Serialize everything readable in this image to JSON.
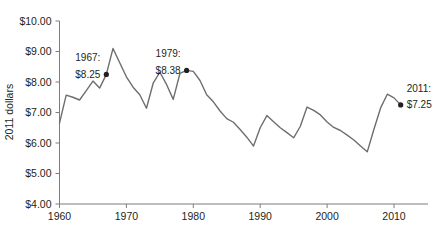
{
  "chart_data": {
    "type": "line",
    "title": "",
    "xlabel": "",
    "ylabel": "2011 dollars",
    "xlim": [
      1959,
      2012
    ],
    "ylim": [
      4.0,
      10.0
    ],
    "grid": false,
    "legend": "none",
    "x_ticks": [
      "1960",
      "1970",
      "1980",
      "1990",
      "2000",
      "2010"
    ],
    "x_tick_values": [
      1960,
      1970,
      1980,
      1990,
      2000,
      2010
    ],
    "y_ticks": [
      "$4.00",
      "$5.00",
      "$6.00",
      "$7.00",
      "$8.00",
      "$9.00",
      "$10.00"
    ],
    "y_tick_values": [
      4.0,
      5.0,
      6.0,
      7.0,
      8.0,
      9.0,
      10.0
    ],
    "series": [
      {
        "name": "Federal minimum wage (2011 dollars)",
        "color": "#6e6e6e",
        "x": [
          1960,
          1961,
          1962,
          1963,
          1964,
          1965,
          1966,
          1967,
          1968,
          1969,
          1970,
          1971,
          1972,
          1973,
          1974,
          1975,
          1976,
          1977,
          1978,
          1979,
          1980,
          1981,
          1982,
          1983,
          1984,
          1985,
          1986,
          1987,
          1988,
          1989,
          1990,
          1991,
          1992,
          1993,
          1994,
          1995,
          1996,
          1997,
          1998,
          1999,
          2000,
          2001,
          2002,
          2003,
          2004,
          2005,
          2006,
          2007,
          2008,
          2009,
          2010,
          2011
        ],
        "y": [
          6.65,
          7.57,
          7.5,
          7.41,
          7.72,
          8.03,
          7.8,
          8.25,
          9.1,
          8.63,
          8.17,
          7.83,
          7.58,
          7.14,
          7.96,
          8.32,
          7.92,
          7.43,
          8.28,
          8.38,
          8.35,
          8.05,
          7.58,
          7.35,
          7.05,
          6.8,
          6.68,
          6.44,
          6.19,
          5.9,
          6.5,
          6.9,
          6.7,
          6.5,
          6.34,
          6.17,
          6.55,
          7.18,
          7.07,
          6.92,
          6.69,
          6.51,
          6.41,
          6.26,
          6.1,
          5.9,
          5.71,
          6.45,
          7.15,
          7.6,
          7.48,
          7.25
        ]
      }
    ],
    "annotations": [
      {
        "id": "1967",
        "year_label": "1967:",
        "value_label": "$8.25",
        "x": 1967,
        "y": 8.25,
        "align": "right"
      },
      {
        "id": "1979",
        "year_label": "1979:",
        "value_label": "$8.38",
        "x": 1979,
        "y": 8.38,
        "align": "right"
      },
      {
        "id": "2011",
        "year_label": "2011:",
        "value_label": "$7.25",
        "x": 2011,
        "y": 7.25,
        "align": "left"
      }
    ]
  }
}
